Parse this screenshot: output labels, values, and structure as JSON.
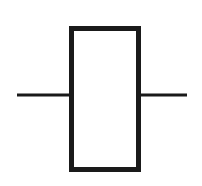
{
  "figure": {
    "kind": "circuit-symbol",
    "symbol_name": "resistor-symbol",
    "title": "",
    "caption": "",
    "background_color": "#ffffff",
    "stroke_color": "#1a1a1a",
    "fill_color": "#ffffff",
    "canvas": {
      "width": 202,
      "height": 186
    },
    "body": {
      "name": "resistor-body-rectangle",
      "x": 69,
      "y": 26,
      "width": 72,
      "height": 146,
      "stroke_width": 5,
      "label": ""
    },
    "leads": [
      {
        "name": "left-terminal-lead",
        "x1": 17,
        "y1": 95,
        "x2": 70,
        "y2": 95,
        "stroke_width": 3,
        "label": ""
      },
      {
        "name": "right-terminal-lead",
        "x1": 140,
        "y1": 95,
        "x2": 187,
        "y2": 95,
        "stroke_width": 3,
        "label": ""
      }
    ]
  }
}
